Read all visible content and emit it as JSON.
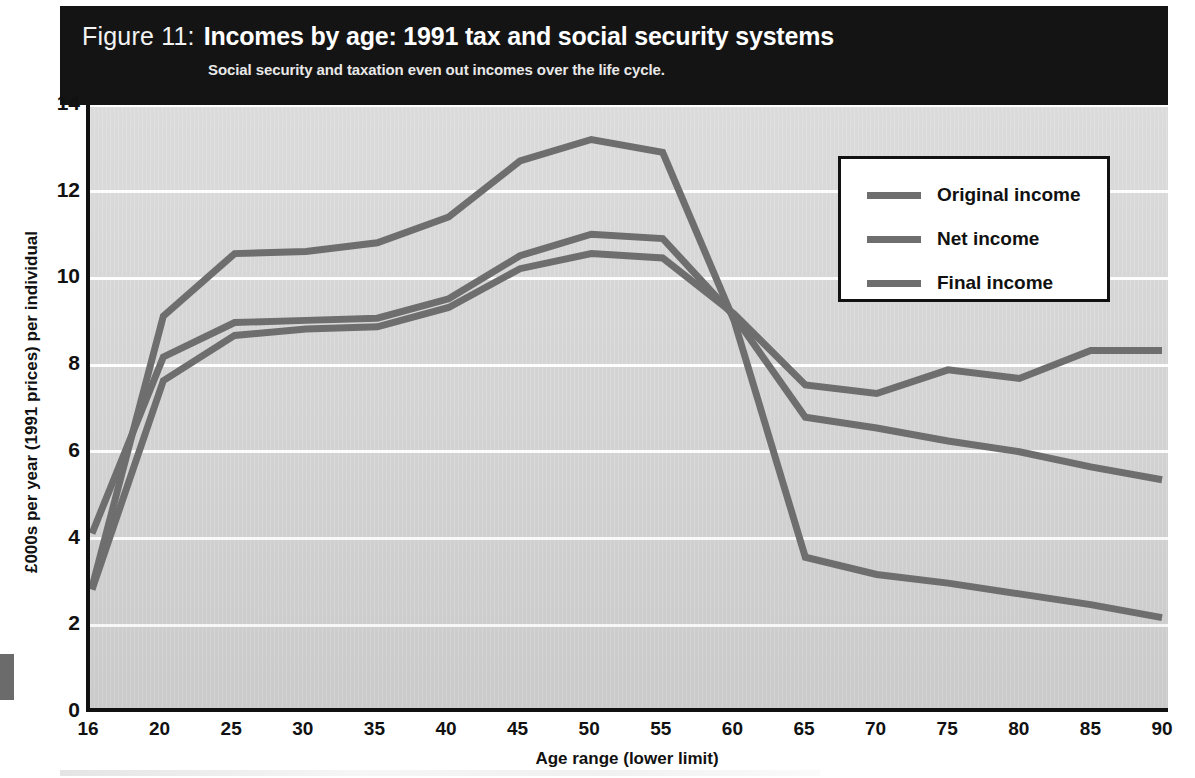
{
  "figure": {
    "label": "Figure 11:",
    "title": "Incomes by age: 1991 tax and social security systems",
    "subtitle": "Social  security and taxation even out incomes over the life cycle."
  },
  "legend": {
    "position": "top-right-inside",
    "items": [
      {
        "label": "Original income",
        "color": "#6e6e6e"
      },
      {
        "label": "Net income",
        "color": "#6e6e6e"
      },
      {
        "label": "Final income",
        "color": "#6e6e6e"
      }
    ]
  },
  "colors": {
    "header_background": "#141414",
    "header_text": "#ffffff",
    "plot_background": "#d2d2d2",
    "gridline": "#fdfdfd",
    "axis": "#111111",
    "line": "#6e6e6e"
  },
  "chart_data": {
    "type": "line",
    "title": "Incomes by age: 1991 tax and social security systems",
    "subtitle": "Social  security and taxation even out incomes over the life cycle.",
    "xlabel": "Age range (lower limit)",
    "ylabel": "£000s per year (1991 prices) per individual",
    "categories": [
      "16",
      "20",
      "25",
      "30",
      "35",
      "40",
      "45",
      "50",
      "55",
      "60",
      "65",
      "70",
      "75",
      "80",
      "85",
      "90"
    ],
    "xticklabels": [
      "16",
      "20",
      "25",
      "30",
      "35",
      "40",
      "45",
      "50",
      "55",
      "60",
      "65",
      "70",
      "75",
      "80",
      "85",
      "90"
    ],
    "yticks": [
      0,
      2,
      4,
      6,
      8,
      10,
      12,
      14
    ],
    "yticklabels": [
      "0",
      "2",
      "4",
      "6",
      "8",
      "10",
      "12",
      "14"
    ],
    "ylim": [
      0,
      14
    ],
    "grid": "horizontal",
    "series": [
      {
        "name": "Original income",
        "color": "#6e6e6e",
        "values": [
          2.8,
          9.1,
          10.55,
          10.6,
          10.8,
          11.4,
          12.7,
          13.2,
          12.9,
          9.0,
          3.5,
          3.1,
          2.9,
          2.65,
          2.4,
          2.1
        ]
      },
      {
        "name": "Net income",
        "color": "#6e6e6e",
        "values": [
          4.05,
          8.15,
          8.95,
          9.0,
          9.05,
          9.5,
          10.5,
          11.0,
          10.9,
          9.1,
          6.75,
          6.5,
          6.2,
          5.95,
          5.6,
          5.3
        ]
      },
      {
        "name": "Final income",
        "color": "#6e6e6e",
        "values": [
          2.75,
          7.6,
          8.65,
          8.8,
          8.85,
          9.3,
          10.2,
          10.55,
          10.45,
          9.15,
          7.5,
          7.3,
          7.85,
          7.65,
          8.3,
          8.3
        ]
      }
    ]
  }
}
